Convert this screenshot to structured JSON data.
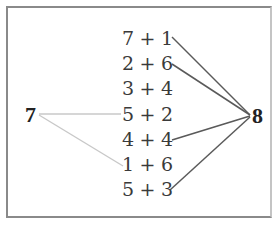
{
  "diagram": {
    "left_number": "7",
    "right_number": "8",
    "expressions": [
      {
        "text": "7 + 1",
        "sum": 8
      },
      {
        "text": "2 + 6",
        "sum": 8
      },
      {
        "text": "3 + 4",
        "sum": 7
      },
      {
        "text": "5 + 2",
        "sum": 7
      },
      {
        "text": "4 + 4",
        "sum": 8
      },
      {
        "text": "1 + 6",
        "sum": 7
      },
      {
        "text": "5 + 3",
        "sum": 8
      }
    ],
    "connections": {
      "to_7": [
        "5 + 2",
        "1 + 6"
      ],
      "to_8": [
        "7 + 1",
        "2 + 6",
        "4 + 4",
        "5 + 3"
      ]
    },
    "colors": {
      "line_to_7": "#c8c8c8",
      "line_to_8": "#5a5a5a",
      "border": "#8a8a8a"
    }
  }
}
